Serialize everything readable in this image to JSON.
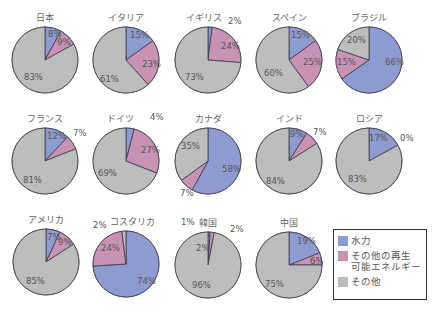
{
  "colors": {
    "hydro": "#8e9bd0",
    "other_renewable": "#c892b4",
    "other": "#bdbdbd",
    "border": "#3a3a4a"
  },
  "legend": {
    "items": [
      {
        "key": "hydro",
        "label": "水力"
      },
      {
        "key": "other_renewable",
        "label": "その他の再生\n可能エネルギー"
      },
      {
        "key": "other",
        "label": "その他"
      }
    ]
  },
  "chart_data": {
    "type": "pie",
    "title": "",
    "series_names": [
      "水力",
      "その他の再生可能エネルギー",
      "その他"
    ],
    "charts": [
      {
        "country": "日本",
        "values": [
          8,
          9,
          83
        ]
      },
      {
        "country": "イタリア",
        "values": [
          15,
          23,
          61
        ]
      },
      {
        "country": "イギリス",
        "values": [
          2,
          24,
          73
        ]
      },
      {
        "country": "スペイン",
        "values": [
          15,
          25,
          60
        ]
      },
      {
        "country": "ブラジル",
        "values": [
          66,
          15,
          20
        ]
      },
      {
        "country": "フランス",
        "values": [
          12,
          7,
          81
        ]
      },
      {
        "country": "ドイツ",
        "values": [
          4,
          27,
          69
        ]
      },
      {
        "country": "カナダ",
        "values": [
          58,
          7,
          35
        ]
      },
      {
        "country": "インド",
        "values": [
          9,
          7,
          84
        ]
      },
      {
        "country": "ロシア",
        "values": [
          17,
          0,
          83
        ]
      },
      {
        "country": "アメリカ",
        "values": [
          7,
          9,
          85
        ]
      },
      {
        "country": "コスタリカ",
        "values": [
          74,
          24,
          2
        ]
      },
      {
        "country": "韓国",
        "values": [
          1,
          2,
          96
        ]
      },
      {
        "country": "中国",
        "values": [
          19,
          6,
          75
        ]
      }
    ]
  },
  "layout": {
    "pies": [
      {
        "cx": 45,
        "cy": 60,
        "labels": [
          {
            "t": "8%",
            "x": 48,
            "y": 37
          },
          {
            "t": "9%",
            "x": 57,
            "y": 45
          },
          {
            "t": "83%",
            "x": 24,
            "y": 80
          }
        ]
      },
      {
        "cx": 126,
        "cy": 60,
        "labels": [
          {
            "t": "15%",
            "x": 130,
            "y": 38
          },
          {
            "t": "23%",
            "x": 142,
            "y": 67
          },
          {
            "t": "61%",
            "x": 100,
            "y": 82
          }
        ]
      },
      {
        "cx": 208,
        "cy": 60,
        "title_dx": -4,
        "outer": {
          "t": "2%",
          "x": 228,
          "y": 24
        },
        "labels": [
          {
            "t": "24%",
            "x": 221,
            "y": 49
          },
          {
            "t": "73%",
            "x": 185,
            "y": 80
          }
        ]
      },
      {
        "cx": 289,
        "cy": 60,
        "labels": [
          {
            "t": "15%",
            "x": 291,
            "y": 38
          },
          {
            "t": "25%",
            "x": 303,
            "y": 65
          },
          {
            "t": "60%",
            "x": 264,
            "y": 76
          }
        ]
      },
      {
        "cx": 369,
        "cy": 60,
        "labels": [
          {
            "t": "20%",
            "x": 347,
            "y": 43
          },
          {
            "t": "15%",
            "x": 337,
            "y": 65
          },
          {
            "t": "66%",
            "x": 385,
            "y": 65
          }
        ]
      },
      {
        "cx": 45,
        "cy": 161,
        "labels": [
          {
            "t": "12%",
            "x": 47,
            "y": 139
          },
          {
            "t": "81%",
            "x": 23,
            "y": 183
          }
        ],
        "outer": {
          "t": "7%",
          "x": 73,
          "y": 136
        }
      },
      {
        "cx": 126,
        "cy": 161,
        "title_dx": -6,
        "outer": {
          "t": "4%",
          "x": 150,
          "y": 120
        },
        "labels": [
          {
            "t": "27%",
            "x": 141,
            "y": 153
          },
          {
            "t": "69%",
            "x": 98,
            "y": 176
          }
        ]
      },
      {
        "cx": 208,
        "cy": 161,
        "labels": [
          {
            "t": "35%",
            "x": 181,
            "y": 149
          },
          {
            "t": "58%",
            "x": 222,
            "y": 172
          }
        ],
        "outer": {
          "t": "7%",
          "x": 180,
          "y": 196
        }
      },
      {
        "cx": 289,
        "cy": 161,
        "labels": [
          {
            "t": "9%",
            "x": 290,
            "y": 137
          },
          {
            "t": "84%",
            "x": 266,
            "y": 184
          }
        ],
        "outer": {
          "t": "7%",
          "x": 313,
          "y": 135
        }
      },
      {
        "cx": 369,
        "cy": 161,
        "labels": [
          {
            "t": "17%",
            "x": 369,
            "y": 141
          },
          {
            "t": "83%",
            "x": 348,
            "y": 182
          }
        ],
        "outer": {
          "t": "0%",
          "x": 400,
          "y": 141
        }
      },
      {
        "cx": 46,
        "cy": 262,
        "labels": [
          {
            "t": "7%",
            "x": 47,
            "y": 240
          },
          {
            "t": "9%",
            "x": 58,
            "y": 245
          },
          {
            "t": "85%",
            "x": 26,
            "y": 284
          }
        ]
      },
      {
        "cx": 126,
        "cy": 264,
        "title_dx": 6,
        "outer": {
          "t": "2%",
          "x": 93,
          "y": 228
        },
        "labels": [
          {
            "t": "24%",
            "x": 101,
            "y": 251
          },
          {
            "t": "74%",
            "x": 137,
            "y": 284
          }
        ]
      },
      {
        "cx": 208,
        "cy": 265,
        "title_dx": 0,
        "outer": {
          "t": "1%",
          "x": 181,
          "y": 225
        },
        "outer2": {
          "t": "2%",
          "x": 230,
          "y": 232
        },
        "labels": [
          {
            "t": "2%",
            "x": 196,
            "y": 251
          },
          {
            "t": "96%",
            "x": 192,
            "y": 288
          }
        ]
      },
      {
        "cx": 289,
        "cy": 265,
        "labels": [
          {
            "t": "19%",
            "x": 297,
            "y": 244
          },
          {
            "t": "6%",
            "x": 310,
            "y": 264
          },
          {
            "t": "75%",
            "x": 265,
            "y": 287
          }
        ]
      }
    ],
    "radius": 33
  }
}
